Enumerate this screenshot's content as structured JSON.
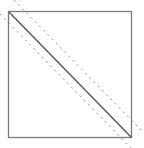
{
  "diagram": {
    "title_fragment": "",
    "box": {
      "x": 8,
      "y": 11,
      "width": 123,
      "height": 126,
      "stroke": "#7a7a7a"
    },
    "main_diagonal": {
      "x1": 8,
      "y1": 11,
      "x2": 131,
      "y2": 137,
      "stroke": "#555555",
      "style": "solid"
    },
    "offset_lines": [
      {
        "name": "upper-dashed",
        "x1": 14,
        "y1": 0,
        "x2": 144,
        "y2": 133,
        "stroke": "#888888",
        "style": "dashed"
      },
      {
        "name": "lower-dashed",
        "x1": 0,
        "y1": 14,
        "x2": 131,
        "y2": 148,
        "stroke": "#888888",
        "style": "dashed"
      }
    ]
  }
}
